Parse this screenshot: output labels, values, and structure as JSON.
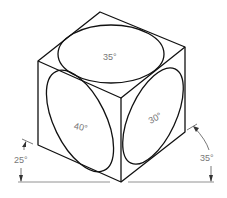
{
  "figure": {
    "labels": {
      "top_face": "35°",
      "left_face": "40°",
      "right_face": "30°",
      "left_angle": "25°",
      "right_angle": "35°"
    },
    "colors": {
      "line": "#111111",
      "label": "#777777",
      "dimension": "#555555",
      "background": "#ffffff"
    }
  }
}
